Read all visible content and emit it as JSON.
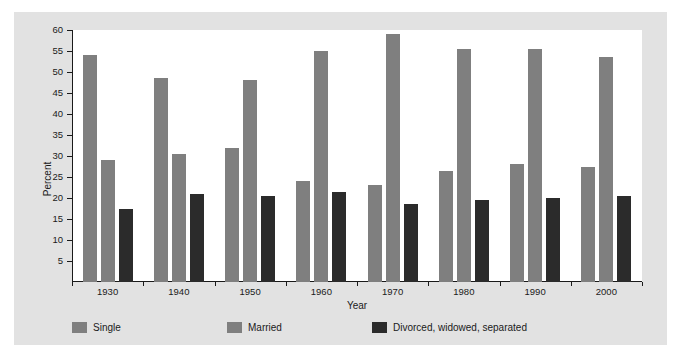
{
  "chart_data": {
    "type": "bar",
    "title": "",
    "xlabel": "Year",
    "ylabel": "Percent",
    "categories": [
      "1930",
      "1940",
      "1950",
      "1960",
      "1970",
      "1980",
      "1990",
      "2000"
    ],
    "ylim": [
      0,
      60
    ],
    "yticks": [
      5,
      10,
      15,
      20,
      25,
      30,
      35,
      40,
      45,
      50,
      55,
      60
    ],
    "grid": false,
    "legend_position": "bottom",
    "series": [
      {
        "name": "Single",
        "color": "#7f7f7f",
        "values": [
          54,
          48.5,
          32,
          24,
          23,
          26.5,
          28,
          27.5
        ]
      },
      {
        "name": "Married",
        "color": "#7f7f7f",
        "values": [
          29,
          30.5,
          48,
          55,
          59,
          55.5,
          55.5,
          53.5
        ]
      },
      {
        "name": "Divorced, widowed, separated",
        "color": "#2b2b2b",
        "values": [
          17.5,
          21,
          20.5,
          21.5,
          18.5,
          19.5,
          20,
          20.5
        ]
      }
    ]
  },
  "figure": {
    "background_color": "#e2e2e2",
    "plot_background_color": "#ffffff",
    "axis_color": "#1a1a1a"
  }
}
